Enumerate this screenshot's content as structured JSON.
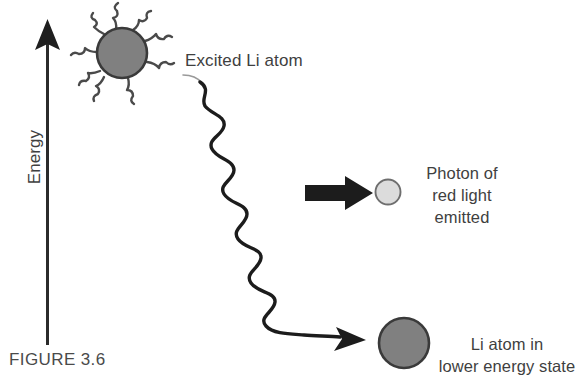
{
  "figure": {
    "caption": "FIGURE 3.6",
    "background_color": "#ffffff",
    "text_color": "#3f3f3f"
  },
  "axis": {
    "label": "Energy",
    "orientation": "vertical",
    "direction": "up",
    "color": "#2b2b2b"
  },
  "excited_atom": {
    "label": "Excited Li atom",
    "fill_color": "#808080",
    "stroke_color": "#3a3a3a",
    "center_x": 122,
    "center_y": 53,
    "radius": 25,
    "squiggle_count": 8
  },
  "photon": {
    "label_lines": [
      "Photon of",
      "red light",
      "emitted"
    ],
    "fill_color": "#dcdcdc",
    "stroke_color": "#6e6e6e",
    "center_x": 388,
    "center_y": 192,
    "radius": 13
  },
  "emission_arrow": {
    "name": "photon-emission-arrow",
    "color": "#1c1c1c",
    "direction": "right"
  },
  "wave": {
    "name": "emitted-photon-wave",
    "color": "#1c1c1c",
    "start_x": 188,
    "start_y": 77,
    "end_x": 344,
    "end_y": 339,
    "oscillations": 8,
    "arrowhead_direction": "down-right"
  },
  "lower_atom": {
    "label_lines": [
      "Li atom in",
      "lower energy state"
    ],
    "fill_color": "#808080",
    "stroke_color": "#3a3a3a",
    "center_x": 404,
    "center_y": 343,
    "radius": 25
  }
}
